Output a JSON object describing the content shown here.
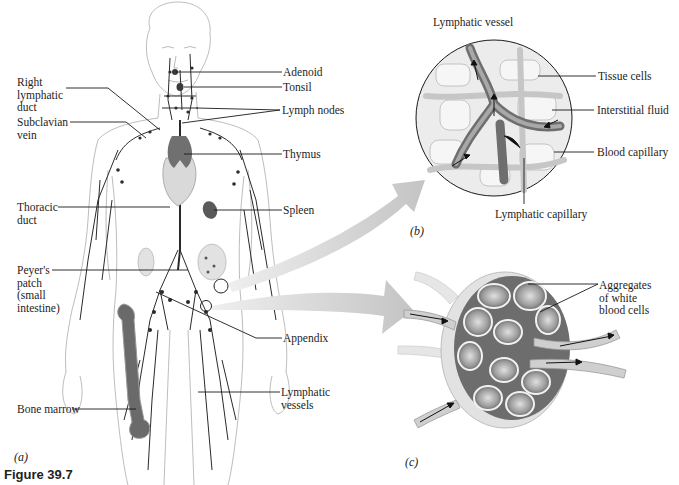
{
  "figure": {
    "caption": "Figure 39.7"
  },
  "panels": {
    "a": {
      "tag": "(a)",
      "labels": {
        "right_lymphatic_duct": [
          "Right",
          "lymphatic",
          "duct"
        ],
        "subclavian_vein": [
          "Subclavian",
          "vein"
        ],
        "thoracic_duct": [
          "Thoracic",
          "duct"
        ],
        "peyers_patch": [
          "Peyer's",
          "patch",
          "(small",
          "intestine)"
        ],
        "bone_marrow": "Bone marrow",
        "adenoid": "Adenoid",
        "tonsil": "Tonsil",
        "lymph_nodes": "Lymph nodes",
        "thymus": "Thymus",
        "spleen": "Spleen",
        "appendix": "Appendix",
        "lymphatic_vessels": [
          "Lymphatic",
          "vessels"
        ]
      }
    },
    "b": {
      "tag": "(b)",
      "labels": {
        "lymphatic_vessel": "Lymphatic vessel",
        "tissue_cells": "Tissue cells",
        "interstitial_fluid": "Interstitial fluid",
        "blood_capillary": "Blood capillary",
        "lymphatic_capillary": "Lymphatic capillary"
      }
    },
    "c": {
      "tag": "(c)",
      "labels": {
        "aggregates": [
          "Aggregates",
          "of white",
          "blood cells"
        ]
      }
    }
  },
  "colors": {
    "line": "#1a1a1a",
    "arrow_fill": "#c9c9c9",
    "body_outline": "#b8b8b8",
    "organ_dark": "#5a5a5a"
  }
}
